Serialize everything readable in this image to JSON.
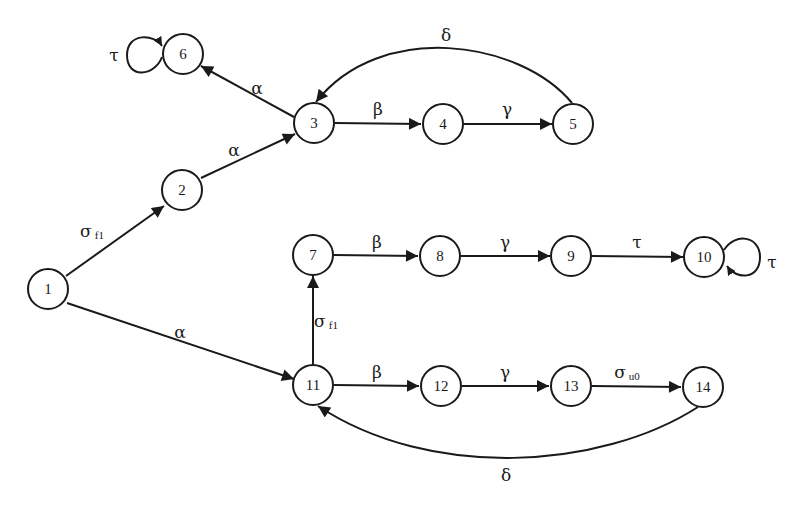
{
  "diagram": {
    "type": "state-transition-graph",
    "nodes": [
      {
        "id": "1",
        "label": "1",
        "x": 48,
        "y": 289
      },
      {
        "id": "2",
        "label": "2",
        "x": 182,
        "y": 190
      },
      {
        "id": "3",
        "label": "3",
        "x": 314,
        "y": 123
      },
      {
        "id": "4",
        "label": "4",
        "x": 443,
        "y": 124
      },
      {
        "id": "5",
        "label": "5",
        "x": 573,
        "y": 124
      },
      {
        "id": "6",
        "label": "6",
        "x": 183,
        "y": 54
      },
      {
        "id": "7",
        "label": "7",
        "x": 313,
        "y": 255
      },
      {
        "id": "8",
        "label": "8",
        "x": 440,
        "y": 256
      },
      {
        "id": "9",
        "label": "9",
        "x": 571,
        "y": 256
      },
      {
        "id": "10",
        "label": "10",
        "x": 704,
        "y": 257
      },
      {
        "id": "11",
        "label": "11",
        "x": 313,
        "y": 385
      },
      {
        "id": "12",
        "label": "12",
        "x": 441,
        "y": 386
      },
      {
        "id": "13",
        "label": "13",
        "x": 571,
        "y": 386
      },
      {
        "id": "14",
        "label": "14",
        "x": 703,
        "y": 387
      }
    ],
    "edges": [
      {
        "from": "1",
        "to": "2",
        "label": "σ",
        "sub": "f1"
      },
      {
        "from": "1",
        "to": "11",
        "label": "α",
        "sub": ""
      },
      {
        "from": "2",
        "to": "3",
        "label": "α",
        "sub": ""
      },
      {
        "from": "3",
        "to": "6",
        "label": "α",
        "sub": ""
      },
      {
        "from": "3",
        "to": "4",
        "label": "β",
        "sub": ""
      },
      {
        "from": "4",
        "to": "5",
        "label": "γ",
        "sub": ""
      },
      {
        "from": "5",
        "to": "3",
        "label": "δ",
        "sub": "",
        "curved": true
      },
      {
        "from": "6",
        "to": "6",
        "label": "τ",
        "sub": "",
        "self_loop": "left"
      },
      {
        "from": "11",
        "to": "7",
        "label": "σ",
        "sub": "f1"
      },
      {
        "from": "7",
        "to": "8",
        "label": "β",
        "sub": ""
      },
      {
        "from": "8",
        "to": "9",
        "label": "γ",
        "sub": ""
      },
      {
        "from": "9",
        "to": "10",
        "label": "τ",
        "sub": ""
      },
      {
        "from": "10",
        "to": "10",
        "label": "τ",
        "sub": "",
        "self_loop": "right"
      },
      {
        "from": "11",
        "to": "12",
        "label": "β",
        "sub": ""
      },
      {
        "from": "12",
        "to": "13",
        "label": "γ",
        "sub": ""
      },
      {
        "from": "13",
        "to": "14",
        "label": "σ",
        "sub": "u0"
      },
      {
        "from": "14",
        "to": "11",
        "label": "δ",
        "sub": "",
        "curved": true
      }
    ]
  },
  "labels": {
    "n1": "1",
    "n2": "2",
    "n3": "3",
    "n4": "4",
    "n5": "5",
    "n6": "6",
    "n7": "7",
    "n8": "8",
    "n9": "9",
    "n10": "10",
    "n11": "11",
    "n12": "12",
    "n13": "13",
    "n14": "14",
    "e1_2": "σ",
    "e1_2_sub": "f1",
    "e1_11": "α",
    "e2_3": "α",
    "e3_6": "α",
    "e3_4": "β",
    "e4_5": "γ",
    "e5_3": "δ",
    "e6_6": "τ",
    "e11_7": "σ",
    "e11_7_sub": "f1",
    "e7_8": "β",
    "e8_9": "γ",
    "e9_10": "τ",
    "e10_10": "τ",
    "e11_12": "β",
    "e12_13": "γ",
    "e13_14": "σ",
    "e13_14_sub": "u0",
    "e14_11": "δ"
  }
}
